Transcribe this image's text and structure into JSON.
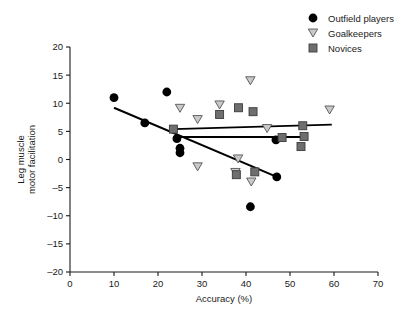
{
  "figure": {
    "title": "",
    "background": "#ffffff"
  },
  "axes": {
    "x": {
      "label": "Accuracy (%)",
      "ticks": [
        0,
        10,
        20,
        30,
        40,
        50,
        60,
        70
      ],
      "tick_labels": [
        "0",
        "10",
        "20",
        "30",
        "40",
        "50",
        "60",
        "70"
      ],
      "min": 0,
      "max": 70
    },
    "y": {
      "label_line1": "Leg muscle",
      "label_line2": "motor facilitation",
      "ticks": [
        -20,
        -15,
        -10,
        -5,
        0,
        5,
        10,
        15,
        20
      ],
      "tick_labels": [
        "–20",
        "–15",
        "–10",
        "–5",
        "0",
        "5",
        "10",
        "15",
        "20"
      ],
      "min": -20,
      "max": 20
    }
  },
  "legend": {
    "position": "top-right",
    "items": [
      {
        "label": "Outfield players",
        "marker": "circle",
        "color": "#000000"
      },
      {
        "label": "Goalkeepers",
        "marker": "triangle-down",
        "color": "#c9c9c9"
      },
      {
        "label": "Novices",
        "marker": "square",
        "color": "#6e6e6e"
      }
    ]
  },
  "chart_data": {
    "type": "scatter",
    "title": "",
    "xlabel": "Accuracy (%)",
    "ylabel": "Leg muscle motor facilitation",
    "xlim": [
      0,
      70
    ],
    "ylim": [
      -20,
      20
    ],
    "xticks": [
      0,
      10,
      20,
      30,
      40,
      50,
      60,
      70
    ],
    "yticks": [
      -20,
      -15,
      -10,
      -5,
      0,
      5,
      10,
      15,
      20
    ],
    "grid": false,
    "legend_position": "top-right",
    "series": [
      {
        "name": "Outfield players",
        "marker": "circle",
        "color": "#000000",
        "points": [
          {
            "x": 10.0,
            "y": 11.0
          },
          {
            "x": 17.0,
            "y": 6.5
          },
          {
            "x": 22.0,
            "y": 12.0
          },
          {
            "x": 24.3,
            "y": 3.7
          },
          {
            "x": 25.0,
            "y": 2.0
          },
          {
            "x": 25.0,
            "y": 1.2
          },
          {
            "x": 41.0,
            "y": -8.4
          },
          {
            "x": 46.8,
            "y": 3.5
          },
          {
            "x": 47.0,
            "y": -3.1
          }
        ],
        "fit_line": {
          "x1": 10.0,
          "y1": 9.2,
          "x2": 47.0,
          "y2": -3.1
        }
      },
      {
        "name": "Goalkeepers",
        "marker": "triangle-down",
        "color": "#c9c9c9",
        "points": [
          {
            "x": 25.0,
            "y": 9.1
          },
          {
            "x": 29.0,
            "y": 7.1
          },
          {
            "x": 29.0,
            "y": -1.3
          },
          {
            "x": 34.0,
            "y": 9.7
          },
          {
            "x": 37.6,
            "y": -2.3
          },
          {
            "x": 38.2,
            "y": 0.1
          },
          {
            "x": 41.0,
            "y": 14.0
          },
          {
            "x": 41.2,
            "y": -4.0
          },
          {
            "x": 44.8,
            "y": 5.5
          },
          {
            "x": 59.0,
            "y": 8.8
          }
        ],
        "fit_line": {
          "x1": 23.5,
          "y1": 5.4,
          "x2": 59.5,
          "y2": 6.2
        }
      },
      {
        "name": "Novices",
        "marker": "square",
        "color": "#6e6e6e",
        "points": [
          {
            "x": 23.5,
            "y": 5.4
          },
          {
            "x": 34.0,
            "y": 8.0
          },
          {
            "x": 38.3,
            "y": 9.2
          },
          {
            "x": 37.8,
            "y": -2.7
          },
          {
            "x": 41.6,
            "y": 8.5
          },
          {
            "x": 42.0,
            "y": -2.2
          },
          {
            "x": 48.2,
            "y": 3.9
          },
          {
            "x": 52.5,
            "y": 2.3
          },
          {
            "x": 52.9,
            "y": 6.0
          },
          {
            "x": 53.2,
            "y": 4.1
          }
        ],
        "fit_line": {
          "x1": 23.5,
          "y1": 4.0,
          "x2": 53.5,
          "y2": 4.0
        }
      }
    ]
  }
}
